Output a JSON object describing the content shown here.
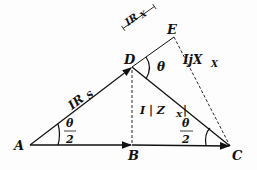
{
  "diagram": {
    "points": {
      "A": {
        "label": "A",
        "x": 30,
        "y": 145
      },
      "B": {
        "label": "B",
        "x": 132,
        "y": 145
      },
      "C": {
        "label": "C",
        "x": 230,
        "y": 146
      },
      "D": {
        "label": "D",
        "x": 132,
        "y": 67
      },
      "E": {
        "label": "E",
        "x": 174,
        "y": 37
      }
    },
    "labels": {
      "IRs": "IR",
      "IRs_sub": "S",
      "IRx": "IR",
      "IRx_sub": "X",
      "IjXx": "IjX",
      "IjXx_sub": "X",
      "IZx": "I | Z",
      "IZx_sub": "X",
      "IZx_end": "|",
      "theta": "θ",
      "half_num": "θ",
      "half_den": "2"
    },
    "colors": {
      "line": "#111111",
      "background": "#fdfdfd"
    }
  }
}
